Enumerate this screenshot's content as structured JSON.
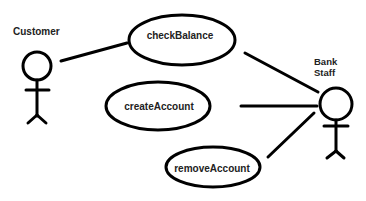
{
  "diagram": {
    "type": "use-case",
    "actors": [
      {
        "id": "customer",
        "label": "Customer"
      },
      {
        "id": "bank_staff",
        "label_line1": "Bank",
        "label_line2": "Staff"
      }
    ],
    "use_cases": [
      {
        "id": "checkBalance",
        "label": "checkBalance"
      },
      {
        "id": "createAccount",
        "label": "createAccount"
      },
      {
        "id": "removeAccount",
        "label": "removeAccount"
      }
    ],
    "associations": [
      {
        "from": "customer",
        "to": "checkBalance"
      },
      {
        "from": "bank_staff",
        "to": "checkBalance"
      },
      {
        "from": "bank_staff",
        "to": "createAccount"
      },
      {
        "from": "bank_staff",
        "to": "removeAccount"
      }
    ],
    "colors": {
      "stroke": "#000000",
      "text": "#222222",
      "background": "#ffffff"
    }
  }
}
